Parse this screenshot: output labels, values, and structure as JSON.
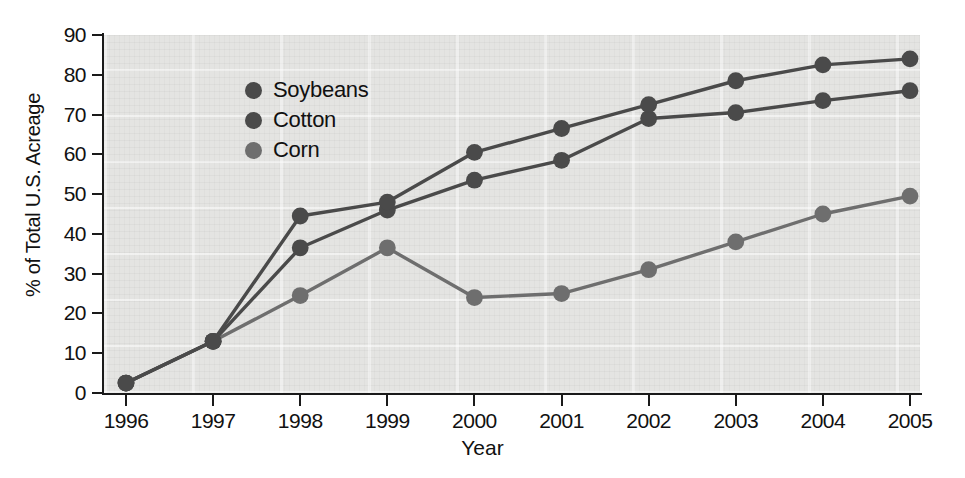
{
  "chart_data": {
    "type": "line",
    "title": "",
    "xlabel": "Year",
    "ylabel": "% of Total U.S. Acreage",
    "x": [
      1996,
      1997,
      1998,
      1999,
      2000,
      2001,
      2002,
      2003,
      2004,
      2005
    ],
    "xticklabels": [
      "1996",
      "1997",
      "1998",
      "1999",
      "2000",
      "2001",
      "2002",
      "2003",
      "2004",
      "2005"
    ],
    "yticklabels": [
      "0",
      "10",
      "20",
      "30",
      "40",
      "50",
      "60",
      "70",
      "80",
      "90"
    ],
    "ylim": [
      0,
      90
    ],
    "ytick_step": 10,
    "grid": false,
    "legend_position": "top-left",
    "series": [
      {
        "name": "Soybeans",
        "color": "#4a4a4a",
        "values": [
          2.5,
          13,
          44.5,
          48,
          60.5,
          66.5,
          72.5,
          78.5,
          82.5,
          84
        ]
      },
      {
        "name": "Cotton",
        "color": "#4a4a4a",
        "values": [
          2.5,
          13,
          36.5,
          46,
          53.5,
          58.5,
          69,
          70.5,
          73.5,
          76
        ]
      },
      {
        "name": "Corn",
        "color": "#6e6e6e",
        "values": [
          2.5,
          13,
          24.5,
          36.5,
          24,
          25,
          31,
          38,
          45,
          49.5
        ]
      }
    ]
  },
  "legend": {
    "items": [
      {
        "label": "Soybeans",
        "color": "#4a4a4a"
      },
      {
        "label": "Cotton",
        "color": "#4a4a4a"
      },
      {
        "label": "Corn",
        "color": "#6e6e6e"
      }
    ]
  },
  "axes": {
    "y_title": "% of Total U.S. Acreage",
    "x_title": "Year"
  },
  "colors": {
    "plot_background": "#e4e4e2",
    "page_background": "#ffffff",
    "axis": "#1a1a1a",
    "text": "#111111",
    "soybeans": "#4a4a4a",
    "cotton": "#4a4a4a",
    "corn": "#6e6e6e"
  }
}
